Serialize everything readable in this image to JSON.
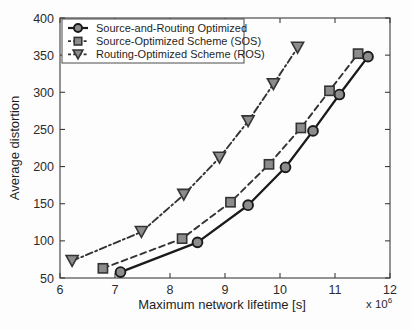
{
  "chart_data": {
    "type": "line",
    "title": "",
    "xlabel": "Maximum network lifetime [s]",
    "ylabel": "Average distortion",
    "x_exponent_prefix": "x 10",
    "x_exponent_value": "6",
    "xlim": [
      6,
      12
    ],
    "ylim": [
      50,
      400
    ],
    "xticks": [
      6,
      7,
      8,
      9,
      10,
      11,
      12
    ],
    "xtick_labels": [
      "6",
      "7",
      "8",
      "9",
      "10",
      "11",
      "12"
    ],
    "yticks": [
      50,
      100,
      150,
      200,
      250,
      300,
      350,
      400
    ],
    "ytick_labels": [
      "50",
      "100",
      "150",
      "200",
      "250",
      "300",
      "350",
      "400"
    ],
    "grid": false,
    "legend_position": "top-left",
    "series": [
      {
        "name": "Source-and-Routing Optimized",
        "marker": "circle",
        "line_style": "solid",
        "color": "#1a1a1a",
        "marker_fill": "#8c8c8c",
        "x": [
          7.1,
          8.5,
          9.42,
          10.1,
          10.6,
          11.08,
          11.6
        ],
        "y": [
          58,
          98,
          148,
          199,
          248,
          297,
          348
        ]
      },
      {
        "name": "Source-Optimized Scheme (SOS)",
        "marker": "square",
        "line_style": "dashed",
        "color": "#333333",
        "marker_fill": "#8c8c8c",
        "x": [
          6.78,
          8.22,
          9.1,
          9.8,
          10.38,
          10.9,
          11.42
        ],
        "y": [
          63,
          103,
          152,
          203,
          252,
          302,
          352
        ]
      },
      {
        "name": "Routing-Optimized Scheme (ROS)",
        "marker": "triangle-down",
        "line_style": "dashdot",
        "color": "#333333",
        "marker_fill": "#8c8c8c",
        "x": [
          6.22,
          7.48,
          8.25,
          8.9,
          9.42,
          9.88,
          10.32
        ],
        "y": [
          73,
          112,
          162,
          212,
          261,
          311,
          360
        ]
      }
    ]
  },
  "legend": {
    "items": [
      {
        "label": "Source-and-Routing Optimized"
      },
      {
        "label": "Source-Optimized Scheme (SOS)"
      },
      {
        "label": "Routing-Optimized Scheme (ROS)"
      }
    ]
  }
}
